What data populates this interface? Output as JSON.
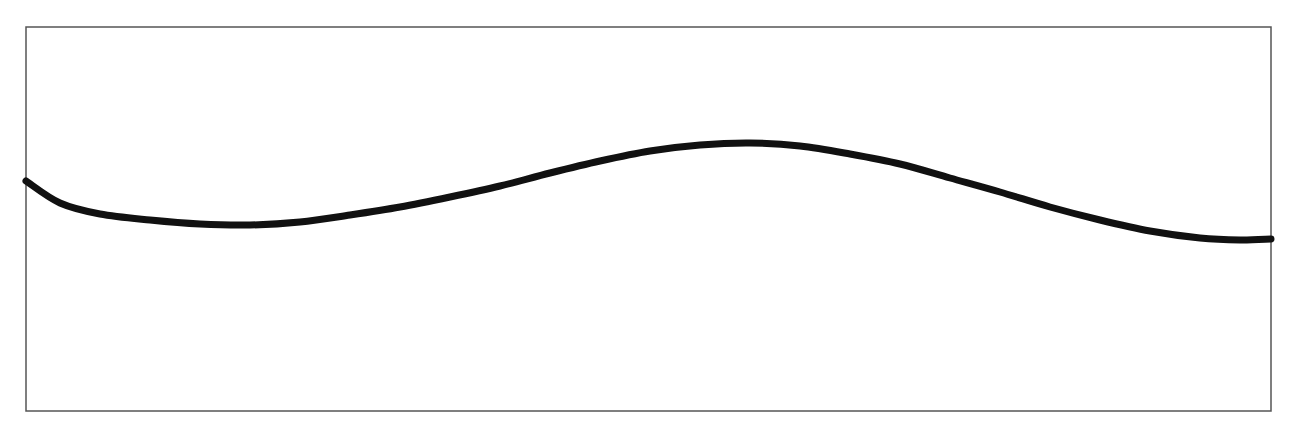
{
  "chart_data": {
    "type": "line",
    "title": "",
    "xlabel": "",
    "ylabel": "",
    "grid": false,
    "legend": null,
    "frame": {
      "left": 26,
      "top": 27,
      "right": 1271,
      "bottom": 411,
      "color": "#555555"
    },
    "line_color": "#111111",
    "line_width": 7,
    "series": [
      {
        "name": "curve",
        "points": [
          [
            26,
            181
          ],
          [
            60,
            203
          ],
          [
            100,
            214
          ],
          [
            150,
            220
          ],
          [
            200,
            224
          ],
          [
            250,
            225
          ],
          [
            300,
            222
          ],
          [
            350,
            215
          ],
          [
            400,
            207
          ],
          [
            450,
            197
          ],
          [
            500,
            186
          ],
          [
            550,
            173
          ],
          [
            600,
            161
          ],
          [
            650,
            151
          ],
          [
            700,
            145
          ],
          [
            750,
            143
          ],
          [
            800,
            146
          ],
          [
            850,
            154
          ],
          [
            900,
            164
          ],
          [
            950,
            178
          ],
          [
            1000,
            192
          ],
          [
            1050,
            207
          ],
          [
            1100,
            220
          ],
          [
            1150,
            231
          ],
          [
            1200,
            238
          ],
          [
            1240,
            240
          ],
          [
            1271,
            239
          ]
        ]
      }
    ]
  }
}
